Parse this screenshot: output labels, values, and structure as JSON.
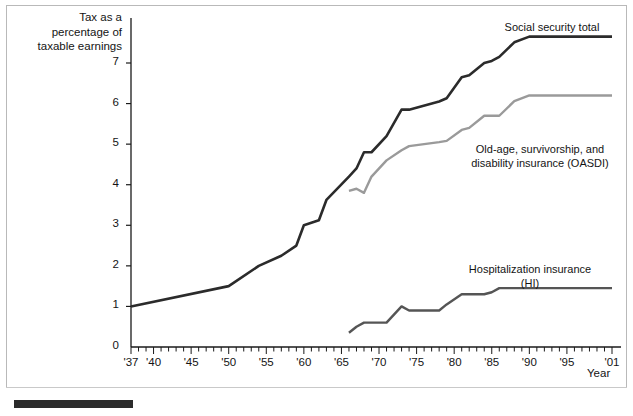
{
  "figure": {
    "background_color": "#ffffff",
    "frame_color": "#b9b9b9",
    "decor_bar_color": "#2b2b2b"
  },
  "axes": {
    "y_axis_title": "Tax as a\npercentage of\ntaxable earnings",
    "x_axis_title": "Year",
    "y_ticks": [
      "0",
      "1",
      "2",
      "3",
      "4",
      "5",
      "6",
      "7"
    ],
    "x_ticks_labeled": [
      "'37",
      "'40",
      "'45",
      "'50",
      "'55",
      "'60",
      "'65",
      "'70",
      "'75",
      "'80",
      "'85",
      "'90",
      "'95",
      "'01"
    ]
  },
  "annotations": {
    "social_security_total": "Social security total",
    "oasdi": "Old-age, survivorship, and\ndisability insurance (OASDI)",
    "hi": "Hospitalization insurance\n(HI)"
  },
  "chart_data": {
    "type": "line",
    "title": "",
    "subtitle": "",
    "xlabel": "Year",
    "ylabel": "Tax as a percentage of taxable earnings",
    "xlim": [
      1937,
      2001
    ],
    "ylim": [
      0,
      8.0
    ],
    "y_ticks": [
      0,
      1,
      2,
      3,
      4,
      5,
      6,
      7
    ],
    "x_ticks": [
      1937,
      1940,
      1945,
      1950,
      1955,
      1960,
      1965,
      1970,
      1975,
      1980,
      1985,
      1990,
      1995,
      2001
    ],
    "grid": false,
    "legend": "inline-annotations",
    "step_style": "post",
    "colors": {
      "social_security_total": "#2b2b2b",
      "oasdi": "#9a9a9a",
      "hi": "#555555"
    },
    "series": [
      {
        "name": "Social security total",
        "color": "#2b2b2b",
        "x": [
          1937,
          1950,
          1954,
          1957,
          1959,
          1960,
          1962,
          1963,
          1966,
          1967,
          1968,
          1969,
          1971,
          1973,
          1974,
          1978,
          1979,
          1981,
          1982,
          1984,
          1985,
          1986,
          1988,
          1990,
          2001
        ],
        "values": [
          1.0,
          1.5,
          2.0,
          2.25,
          2.5,
          3.0,
          3.125,
          3.625,
          4.2,
          4.4,
          4.8,
          4.8,
          5.2,
          5.85,
          5.85,
          6.05,
          6.13,
          6.65,
          6.7,
          7.0,
          7.05,
          7.15,
          7.51,
          7.65,
          7.65
        ]
      },
      {
        "name": "Old-age, survivorship, and disability insurance (OASDI)",
        "color": "#9a9a9a",
        "x": [
          1966,
          1967,
          1968,
          1969,
          1971,
          1973,
          1974,
          1978,
          1979,
          1981,
          1982,
          1984,
          1985,
          1986,
          1988,
          1990,
          2001
        ],
        "values": [
          3.85,
          3.9,
          3.8,
          4.2,
          4.6,
          4.85,
          4.95,
          5.05,
          5.08,
          5.35,
          5.4,
          5.7,
          5.7,
          5.7,
          6.06,
          6.2,
          6.2
        ]
      },
      {
        "name": "Hospitalization insurance (HI)",
        "color": "#555555",
        "x": [
          1966,
          1967,
          1968,
          1969,
          1971,
          1973,
          1974,
          1978,
          1979,
          1981,
          1982,
          1984,
          1985,
          1986,
          1988,
          1990,
          2001
        ],
        "values": [
          0.35,
          0.5,
          0.6,
          0.6,
          0.6,
          1.0,
          0.9,
          0.9,
          1.05,
          1.3,
          1.3,
          1.3,
          1.35,
          1.45,
          1.45,
          1.45,
          1.45
        ]
      }
    ]
  }
}
